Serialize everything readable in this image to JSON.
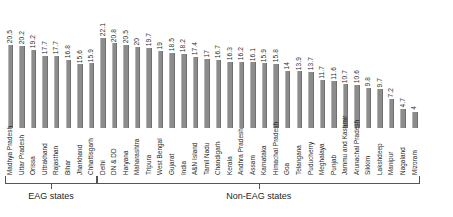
{
  "chart_data": {
    "type": "bar",
    "title": "",
    "subtitle": "",
    "xlabel": "",
    "ylabel": "",
    "ylim": [
      0,
      23
    ],
    "grid": false,
    "legend": null,
    "orientation": "vertical",
    "value_labels": true,
    "bar_color": "#8c8c8c",
    "categories": [
      "Madhya Pradesh",
      "Uttar Pradesh",
      "Orissa",
      "Uttrakhand",
      "Rajasthan",
      "Bihar",
      "Jharkhand",
      "Chhattisgarh",
      "Delhi",
      "DN & DD",
      "Haryana",
      "Maharashtra",
      "Tripura",
      "West Bengal",
      "Gujarat",
      "India",
      "A&N Island",
      "Tamil Nadu",
      "Chandigarh",
      "Kerala",
      "Andhra Pradesh",
      "Assam",
      "Karnataka",
      "Himachal Pradesh",
      "Goa",
      "Telangana",
      "Puducherry",
      "Meghalaya",
      "Punjab",
      "Jammu and Kashmir",
      "Arunachal Pradesh",
      "Sikkim",
      "Lakshdeep",
      "Manipur",
      "Nagaland",
      "Mizoram"
    ],
    "values": [
      20.5,
      20.2,
      19.2,
      17.7,
      17.7,
      16.8,
      15.6,
      15.9,
      22.1,
      20.8,
      20.5,
      20,
      19.7,
      19,
      18.5,
      18.2,
      17.4,
      17,
      16.7,
      16.3,
      16.2,
      16.1,
      15.9,
      15.8,
      14,
      13.9,
      13.7,
      11.7,
      11.6,
      10.7,
      10.6,
      9.8,
      9.7,
      7.2,
      4.7,
      4
    ],
    "value_label_text": [
      "20.5",
      "20.2",
      "19.2",
      "17.7",
      "17.7",
      "16.8",
      "15.6",
      "15.9",
      "22.1",
      "20.8",
      "20.5",
      "20",
      "19.7",
      "19",
      "18.5",
      "18.2",
      "17.4",
      "17",
      "16.7",
      "16.3",
      "16.2",
      "16.1",
      "15.9",
      "15.8",
      "14",
      "13.9",
      "13.7",
      "11.7",
      "11.6",
      "10.7",
      "10.6",
      "9.8",
      "9.7",
      "7.2",
      "4.7",
      "4"
    ],
    "groups": [
      {
        "label": "EAG states",
        "start_index": 0,
        "end_index": 7
      },
      {
        "label": "Non-EAG states",
        "start_index": 8,
        "end_index": 35
      }
    ]
  }
}
